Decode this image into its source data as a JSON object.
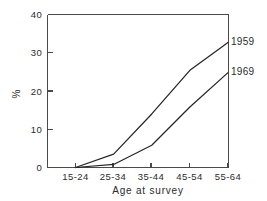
{
  "chart_data": {
    "type": "line",
    "title": "",
    "subtitle": "",
    "xlabel": "Age at survey",
    "ylabel": "%",
    "categories": [
      "15-24",
      "25-34",
      "35-44",
      "45-54",
      "55-64"
    ],
    "xtick_labels": [
      "15-24",
      "25-34",
      "35-44",
      "45-54",
      "55-64"
    ],
    "ytick_labels": [
      "0",
      "10",
      "20",
      "30",
      "40"
    ],
    "ytick_values": [
      0,
      10,
      20,
      30,
      40
    ],
    "ylim": [
      0,
      40
    ],
    "grid": false,
    "legend_position": "right-inline-end-of-line",
    "series": [
      {
        "name": "1959",
        "label": "1959",
        "color": "#262626",
        "values": [
          0,
          3.5,
          14.0,
          25.4,
          32.7
        ]
      },
      {
        "name": "1969",
        "label": "1969",
        "color": "#262626",
        "values": [
          0,
          0.8,
          5.8,
          15.8,
          24.8
        ]
      }
    ]
  },
  "axis": {
    "y_unit_label": "%",
    "x_axis_title": "Age at survey"
  }
}
